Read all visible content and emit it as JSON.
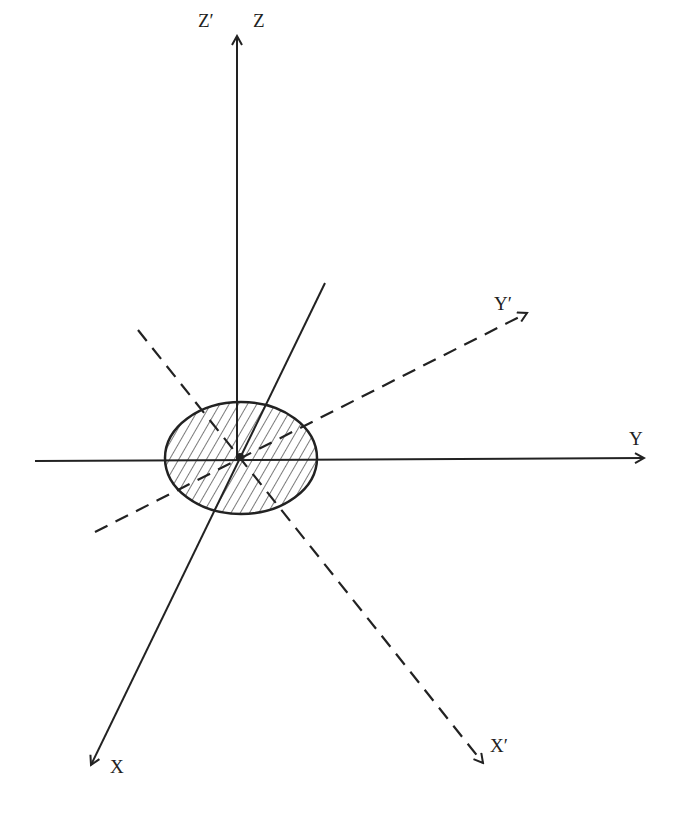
{
  "diagram": {
    "type": "coordinate-axes-rotation",
    "colors": {
      "line": "#222222",
      "background": "#ffffff",
      "hatch": "#333333"
    },
    "labels": {
      "z_prime": "Z′",
      "z": "Z",
      "y": "Y",
      "y_prime": "Y′",
      "x": "X",
      "x_prime": "X′"
    },
    "origin": {
      "x": 240,
      "y": 458
    },
    "axes": [
      {
        "name": "Z",
        "style": "solid",
        "from": [
          237,
          460
        ],
        "to": [
          237,
          35
        ],
        "arrow": true
      },
      {
        "name": "Y",
        "style": "solid",
        "from": [
          35,
          461
        ],
        "to": [
          645,
          458
        ],
        "arrow": true
      },
      {
        "name": "X",
        "style": "solid",
        "from": [
          325,
          283
        ],
        "to": [
          90,
          766
        ],
        "arrow": true
      },
      {
        "name": "X'",
        "style": "dashed",
        "from": [
          138,
          330
        ],
        "to": [
          484,
          764
        ],
        "arrow": true
      },
      {
        "name": "Y'",
        "style": "dashed",
        "from": [
          95,
          532
        ],
        "to": [
          528,
          312
        ],
        "arrow": true
      }
    ],
    "ellipse": {
      "cx": 241,
      "cy": 458,
      "rx": 76,
      "ry": 56,
      "fill": "hatched"
    }
  }
}
